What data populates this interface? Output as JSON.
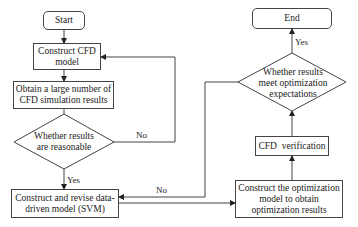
{
  "diagram": {
    "type": "flowchart",
    "nodes": {
      "start": {
        "label": "Start",
        "shape": "terminal"
      },
      "construct_cfd": {
        "label": "Construct CFD model",
        "shape": "process"
      },
      "obtain_results": {
        "label": "Obtain a large number of CFD simulation results",
        "shape": "process"
      },
      "check_reasonable": {
        "label": "Whether results are reasonable",
        "shape": "decision"
      },
      "construct_svm": {
        "label": "Construct and revise data-driven model (SVM)",
        "shape": "process"
      },
      "optimization_model": {
        "label": "Construct the optimization model to obtain optimization results",
        "shape": "process"
      },
      "cfd_verification": {
        "label": "CFD  verification",
        "shape": "process"
      },
      "check_expectations": {
        "label": "Whether results meet optimization expectations",
        "shape": "decision"
      },
      "end": {
        "label": "End",
        "shape": "terminal"
      }
    },
    "edge_labels": {
      "reasonable_yes": "Yes",
      "reasonable_no": "No",
      "expectations_yes": "Yes",
      "expectations_no": "No"
    },
    "edges": [
      {
        "from": "start",
        "to": "construct_cfd"
      },
      {
        "from": "construct_cfd",
        "to": "obtain_results"
      },
      {
        "from": "obtain_results",
        "to": "check_reasonable"
      },
      {
        "from": "check_reasonable",
        "to": "construct_svm",
        "label": "Yes"
      },
      {
        "from": "check_reasonable",
        "to": "construct_cfd",
        "label": "No"
      },
      {
        "from": "construct_svm",
        "to": "optimization_model"
      },
      {
        "from": "optimization_model",
        "to": "cfd_verification"
      },
      {
        "from": "cfd_verification",
        "to": "check_expectations"
      },
      {
        "from": "check_expectations",
        "to": "end",
        "label": "Yes"
      },
      {
        "from": "check_expectations",
        "to": "construct_svm",
        "label": "No"
      }
    ],
    "colors": {
      "stroke": "#444444",
      "text": "#222222",
      "background": "#ffffff"
    }
  }
}
